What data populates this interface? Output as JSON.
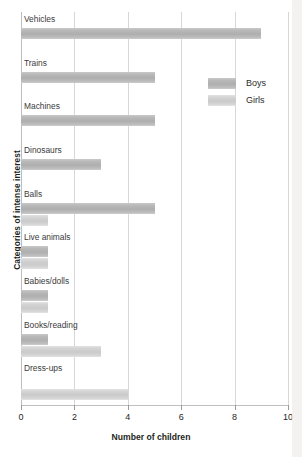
{
  "chart_data": {
    "type": "bar",
    "orientation": "horizontal",
    "title": "",
    "xlabel": "Number of children",
    "ylabel": "Categories of intense interest",
    "xlim": [
      0,
      10
    ],
    "xticks": [
      0,
      2,
      4,
      6,
      8,
      10
    ],
    "xtick_labels": [
      "0",
      "2",
      "4",
      "6",
      "8",
      "10"
    ],
    "grid": true,
    "legend_position": "upper right",
    "categories": [
      "Vehicles",
      "Trains",
      "Machines",
      "Dinosaurs",
      "Balls",
      "Live animals",
      "Babies/dolls",
      "Books/reading",
      "Dress-ups"
    ],
    "series": [
      {
        "name": "Boys",
        "color": "#b3b3b3",
        "values": [
          9,
          5,
          5,
          3,
          5,
          1,
          1,
          1,
          0
        ]
      },
      {
        "name": "Girls",
        "color": "#d2d2d2",
        "values": [
          0,
          0,
          0,
          0,
          1,
          1,
          1,
          3,
          4
        ]
      }
    ]
  },
  "legend": {
    "items": [
      {
        "label": "Boys",
        "series_key": "boys"
      },
      {
        "label": "Girls",
        "series_key": "girls"
      }
    ]
  },
  "axes": {
    "x_title": "Number of children",
    "y_title": "Categories of intense interest"
  }
}
